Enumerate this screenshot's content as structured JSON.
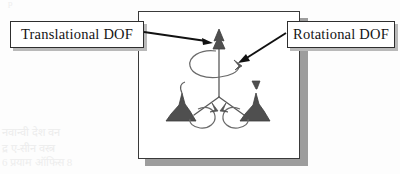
{
  "figure": {
    "type": "engineering-diagram",
    "callouts": [
      {
        "id": "translational",
        "label": "Translational DOF",
        "position": "left",
        "points_to": "upper arrow marker on vertical limb"
      },
      {
        "id": "rotational",
        "label": "Rotational DOF",
        "position": "right",
        "points_to": "curved rotation arrow at upper limb"
      }
    ],
    "markers": {
      "translation_count": 3,
      "rotation_count": 3,
      "description": "Three limbs radiating from a central hub; each limb carries a solid cone translational arrow and an open curved rotational arrow."
    },
    "ghost_text": {
      "a": "p",
      "b": "a Serv",
      "c": "नवान्वी देश वन",
      "d": "द्र ए-सीन वस्त्र",
      "e": "6    प्रयाम ऑफिस  8"
    },
    "colors": {
      "frame_border": "#3a3a3a",
      "frame_shadow": "#9d9d9d",
      "callout_border": "#2e2e2e",
      "callout_shadow": "#b9b9b9",
      "marker_fill": "#4f4f4f",
      "line_stroke": "#555555",
      "arrow_stroke": "#111111",
      "page_background": "#fdfdfd"
    }
  }
}
